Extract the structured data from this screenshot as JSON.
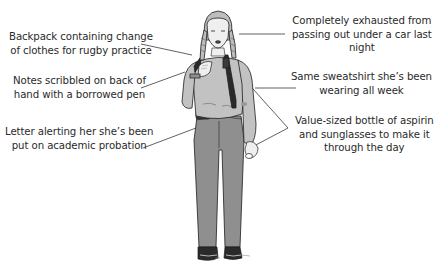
{
  "diagram": {
    "type": "annotated-illustration",
    "colors": {
      "text": "#2a2a2a",
      "leader_line": "#3a3a3a",
      "sweatshirt": "#c2c2c2",
      "pants": "#8f8f8f",
      "skin": "#efefef",
      "outline": "#1e1e1e"
    },
    "callouts": [
      {
        "id": "backpack",
        "side": "left",
        "lines": [
          "Backpack containing change",
          "of clothes for rugby practice"
        ]
      },
      {
        "id": "hand-notes",
        "side": "left",
        "lines": [
          "Notes scribbled on back of",
          "hand with a borrowed pen"
        ]
      },
      {
        "id": "letter",
        "side": "left",
        "lines": [
          "Letter alerting her she’s been",
          "put on academic probation"
        ]
      },
      {
        "id": "exhausted",
        "side": "right",
        "lines": [
          "Completely exhausted from",
          "passing out under a car last",
          "night"
        ]
      },
      {
        "id": "sweatshirt",
        "side": "right",
        "lines": [
          "Same sweatshirt she’s been",
          "wearing all week"
        ]
      },
      {
        "id": "aspirin",
        "side": "right",
        "lines": [
          "Value-sized bottle of aspirin",
          "and sunglasses to make it",
          "through the day"
        ]
      }
    ]
  }
}
